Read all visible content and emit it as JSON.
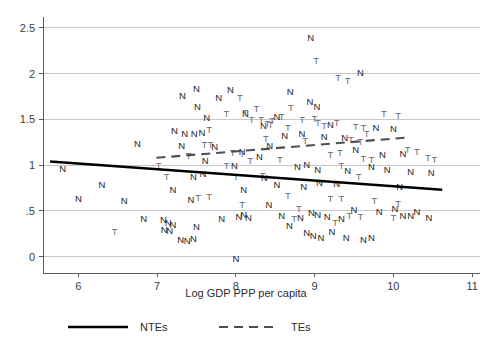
{
  "chart_data": {
    "type": "scatter",
    "title": "",
    "subtitle": "",
    "xlabel": "Log GDP PPP per capita",
    "ylabel": "",
    "xlim": [
      5.55,
      11.1
    ],
    "ylim": [
      -0.18,
      2.62
    ],
    "grid": true,
    "grid_axis": "y",
    "xticks": [
      6,
      7,
      8,
      9,
      10,
      11
    ],
    "xticklabels": [
      "6",
      "7",
      "8",
      "9",
      "10",
      "11"
    ],
    "yticks": [
      0,
      0.5,
      1,
      1.5,
      2,
      2.5
    ],
    "yticklabels": [
      "0",
      ".5",
      "1",
      "1.5",
      "2",
      "2.5"
    ],
    "legend_position": "below-axes",
    "legend": [
      {
        "name": "NTEs",
        "marker": "N",
        "line": "solid",
        "color": "#000000"
      },
      {
        "name": "TEs",
        "marker": "T",
        "line": "dashed",
        "color": "#4e4e54"
      }
    ],
    "series": [
      {
        "name": "NTEs",
        "marker_glyph": "N",
        "points": [
          [
            8.95,
            2.38
          ],
          [
            9.58,
            2.0
          ],
          [
            7.5,
            1.83
          ],
          [
            7.93,
            1.82
          ],
          [
            7.32,
            1.75
          ],
          [
            7.78,
            1.73
          ],
          [
            7.51,
            1.63
          ],
          [
            7.63,
            1.51
          ],
          [
            8.69,
            1.79
          ],
          [
            8.94,
            1.69
          ],
          [
            9.03,
            1.63
          ],
          [
            8.52,
            1.52
          ],
          [
            8.12,
            1.55
          ],
          [
            7.22,
            1.37
          ],
          [
            7.35,
            1.33
          ],
          [
            7.47,
            1.33
          ],
          [
            7.57,
            1.35
          ],
          [
            9.2,
            1.43
          ],
          [
            9.78,
            1.4
          ],
          [
            10.0,
            1.39
          ],
          [
            6.75,
            1.23
          ],
          [
            7.31,
            1.2
          ],
          [
            7.73,
            1.19
          ],
          [
            8.35,
            1.42
          ],
          [
            8.62,
            1.31
          ],
          [
            8.84,
            1.33
          ],
          [
            9.12,
            1.3
          ],
          [
            9.38,
            1.29
          ],
          [
            8.08,
            1.14
          ],
          [
            8.43,
            1.2
          ],
          [
            8.3,
            1.08
          ],
          [
            9.52,
            1.16
          ],
          [
            9.86,
            1.1
          ],
          [
            10.12,
            1.12
          ],
          [
            7.61,
            1.04
          ],
          [
            7.98,
            0.99
          ],
          [
            5.8,
            0.95
          ],
          [
            8.78,
            0.97
          ],
          [
            8.9,
            1.0
          ],
          [
            9.04,
            0.94
          ],
          [
            9.42,
            0.93
          ],
          [
            9.72,
            0.97
          ],
          [
            9.92,
            0.94
          ],
          [
            10.22,
            0.92
          ],
          [
            10.48,
            0.91
          ],
          [
            6.3,
            0.78
          ],
          [
            7.2,
            0.72
          ],
          [
            7.46,
            0.87
          ],
          [
            7.58,
            0.9
          ],
          [
            8.1,
            0.72
          ],
          [
            8.36,
            0.85
          ],
          [
            6.0,
            0.62
          ],
          [
            7.43,
            0.61
          ],
          [
            8.52,
            0.78
          ],
          [
            8.86,
            0.76
          ],
          [
            9.06,
            0.8
          ],
          [
            9.28,
            0.79
          ],
          [
            10.08,
            0.76
          ],
          [
            6.83,
            0.4
          ],
          [
            7.08,
            0.39
          ],
          [
            7.14,
            0.36
          ],
          [
            7.2,
            0.34
          ],
          [
            7.09,
            0.28
          ],
          [
            7.16,
            0.27
          ],
          [
            7.5,
            0.32
          ],
          [
            7.82,
            0.4
          ],
          [
            8.04,
            0.43
          ],
          [
            8.1,
            0.45
          ],
          [
            8.16,
            0.42
          ],
          [
            8.58,
            0.44
          ],
          [
            8.82,
            0.42
          ],
          [
            8.96,
            0.47
          ],
          [
            9.04,
            0.45
          ],
          [
            9.16,
            0.43
          ],
          [
            9.34,
            0.4
          ],
          [
            8.68,
            0.33
          ],
          [
            9.5,
            0.5
          ],
          [
            9.82,
            0.48
          ],
          [
            10.02,
            0.52
          ],
          [
            10.3,
            0.48
          ],
          [
            10.45,
            0.42
          ],
          [
            7.3,
            0.18
          ],
          [
            7.38,
            0.17
          ],
          [
            7.46,
            0.19
          ],
          [
            8.9,
            0.25
          ],
          [
            8.98,
            0.22
          ],
          [
            9.08,
            0.2
          ],
          [
            9.22,
            0.26
          ],
          [
            8.0,
            -0.03
          ],
          [
            9.4,
            0.2
          ],
          [
            9.62,
            0.18
          ],
          [
            9.72,
            0.2
          ],
          [
            10.12,
            0.44
          ],
          [
            10.22,
            0.44
          ],
          [
            6.58,
            0.6
          ],
          [
            8.42,
            0.56
          ]
        ]
      },
      {
        "name": "TEs",
        "marker_glyph": "T",
        "points": [
          [
            9.02,
            2.13
          ],
          [
            9.3,
            1.95
          ],
          [
            9.42,
            1.92
          ],
          [
            8.05,
            1.73
          ],
          [
            8.58,
            1.52
          ],
          [
            9.28,
            1.45
          ],
          [
            7.66,
            1.38
          ],
          [
            9.52,
            1.41
          ],
          [
            9.62,
            1.4
          ],
          [
            8.2,
            1.49
          ],
          [
            8.32,
            1.49
          ],
          [
            8.46,
            1.48
          ],
          [
            8.84,
            1.49
          ],
          [
            9.0,
            1.5
          ],
          [
            9.04,
            1.46
          ],
          [
            10.06,
            1.53
          ],
          [
            7.88,
            1.55
          ],
          [
            8.12,
            1.57
          ],
          [
            8.26,
            1.61
          ],
          [
            8.7,
            1.62
          ],
          [
            8.4,
            1.44
          ],
          [
            8.44,
            1.43
          ],
          [
            9.12,
            1.42
          ],
          [
            8.66,
            1.4
          ],
          [
            9.66,
            1.34
          ],
          [
            9.88,
            1.55
          ],
          [
            7.6,
            1.22
          ],
          [
            7.68,
            1.22
          ],
          [
            8.88,
            1.26
          ],
          [
            8.38,
            1.28
          ],
          [
            9.46,
            1.27
          ],
          [
            9.58,
            1.25
          ],
          [
            7.96,
            1.13
          ],
          [
            8.08,
            1.12
          ],
          [
            9.2,
            1.11
          ],
          [
            9.32,
            1.13
          ],
          [
            10.18,
            1.16
          ],
          [
            10.3,
            1.14
          ],
          [
            7.4,
            1.09
          ],
          [
            8.18,
            1.04
          ],
          [
            8.56,
            1.05
          ],
          [
            9.62,
            1.06
          ],
          [
            9.72,
            1.05
          ],
          [
            10.44,
            1.07
          ],
          [
            10.52,
            1.05
          ],
          [
            7.02,
            0.98
          ],
          [
            7.88,
            0.99
          ],
          [
            9.34,
            0.98
          ],
          [
            8.0,
            0.86
          ],
          [
            8.34,
            0.88
          ],
          [
            9.56,
            0.87
          ],
          [
            7.12,
            0.87
          ],
          [
            7.52,
            0.64
          ],
          [
            7.66,
            0.65
          ],
          [
            8.66,
            0.66
          ],
          [
            9.2,
            0.62
          ],
          [
            9.34,
            0.62
          ],
          [
            9.76,
            0.6
          ],
          [
            10.06,
            0.57
          ],
          [
            9.44,
            0.44
          ],
          [
            9.58,
            0.43
          ],
          [
            10.0,
            0.42
          ],
          [
            8.74,
            0.4
          ],
          [
            8.08,
            0.56
          ],
          [
            8.8,
            0.52
          ],
          [
            6.46,
            0.26
          ],
          [
            9.26,
            0.36
          ]
        ]
      }
    ],
    "fit_lines": [
      {
        "name": "NTEs",
        "style": "solid",
        "color": "#000000",
        "x_start": 5.64,
        "y_start": 1.04,
        "x_end": 10.62,
        "y_end": 0.73
      },
      {
        "name": "TEs",
        "style": "dashed",
        "color": "#4e4e54",
        "x_start": 6.99,
        "y_start": 1.08,
        "x_end": 10.15,
        "y_end": 1.3
      }
    ]
  },
  "axis": {
    "x_title": "Log GDP PPP per capita"
  },
  "legend": {
    "item1_label": "NTEs",
    "item2_label": "TEs"
  }
}
